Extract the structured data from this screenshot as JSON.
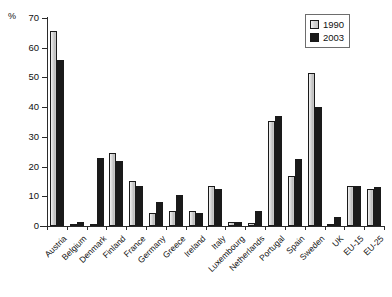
{
  "chart": {
    "unit_label": "%",
    "legend": {
      "position": "top-right",
      "items": [
        {
          "label": "1990",
          "color": "#d2d2d2",
          "key": "v1990"
        },
        {
          "label": "2003",
          "color": "#1a1a1a",
          "key": "v2003"
        }
      ]
    }
  },
  "chart_data": {
    "type": "bar",
    "title": "",
    "xlabel": "",
    "ylabel": "%",
    "ylim": [
      0,
      70
    ],
    "yticks": [
      0,
      10,
      20,
      30,
      40,
      50,
      60,
      70
    ],
    "grid": false,
    "legend_position": "top-right",
    "categories": [
      "Austria",
      "Belgium",
      "Denmark",
      "Finland",
      "France",
      "Germany",
      "Greece",
      "Ireland",
      "Italy",
      "Luxembourg",
      "Netherlands",
      "Portugal",
      "Spain",
      "Sweden",
      "UK",
      "EU-15",
      "EU-25"
    ],
    "series": [
      {
        "name": "1990",
        "color": "#d2d2d2",
        "values": [
          65.5,
          0.4,
          0.8,
          24.5,
          15.0,
          4.5,
          5.0,
          5.0,
          13.5,
          1.5,
          1.0,
          35.5,
          17.0,
          51.5,
          0.8,
          13.5,
          12.5
        ]
      },
      {
        "name": "2003",
        "color": "#1a1a1a",
        "values": [
          56.0,
          1.3,
          23.0,
          22.0,
          13.5,
          8.0,
          10.5,
          4.5,
          12.5,
          1.5,
          5.0,
          37.0,
          22.5,
          40.0,
          3.0,
          13.5,
          13.0
        ]
      }
    ]
  }
}
